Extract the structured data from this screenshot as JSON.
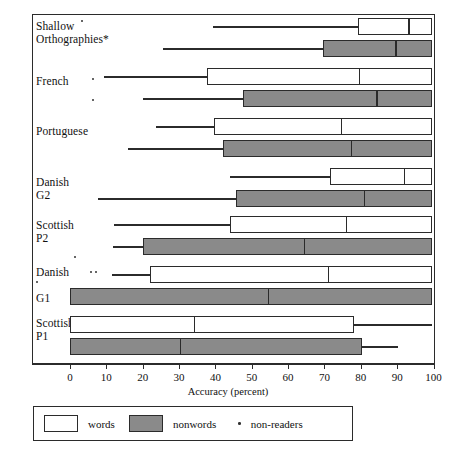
{
  "chart_data": {
    "type": "bar",
    "subtype": "grouped-horizontal-boxplot",
    "title": "",
    "xlabel": "Accuracy (percent)",
    "ylabel": "",
    "xlim": [
      0,
      100
    ],
    "xticks": [
      0,
      10,
      20,
      30,
      40,
      50,
      60,
      70,
      80,
      90,
      100
    ],
    "xticklabels": [
      "0",
      "10",
      "20",
      "30",
      "40",
      "50",
      "60",
      "70",
      "80",
      "90",
      "100"
    ],
    "grid": false,
    "legend_position": "below-axis",
    "legend": [
      {
        "key": "words",
        "label": "words",
        "marker": "open-rectangle",
        "color": "#ffffff"
      },
      {
        "key": "nonwords",
        "label": "nonwords",
        "marker": "filled-rectangle",
        "color": "#8a8a8a"
      },
      {
        "key": "non-readers",
        "label": "non-readers",
        "marker": "dot",
        "color": "#333333"
      }
    ],
    "categories": [
      "Shallow Orthographies*",
      "French",
      "Portuguese",
      "Danish G2",
      "Scottish P2",
      "Danish G1",
      "Scottish P1"
    ],
    "series": [
      {
        "name": "words",
        "boxes": [
          {
            "category": "Shallow Orthographies*",
            "whisker_low": 39.3,
            "q1": 79.1,
            "median": 93.1,
            "q3": 99.7,
            "whisker_high": 99.7
          },
          {
            "category": "French",
            "whisker_low": 9.3,
            "q1": 37.6,
            "median": 79.4,
            "q3": 99.7,
            "whisker_high": 99.7
          },
          {
            "category": "Portuguese",
            "whisker_low": 23.6,
            "q1": 39.5,
            "median": 74.5,
            "q3": 99.7,
            "whisker_high": 99.7
          },
          {
            "category": "Danish G2",
            "whisker_low": 43.9,
            "q1": 71.4,
            "median": 91.8,
            "q3": 99.7,
            "whisker_high": 99.7
          },
          {
            "category": "Scottish P2",
            "whisker_low": 12.1,
            "q1": 43.9,
            "median": 75.8,
            "q3": 99.7,
            "whisker_high": 99.7
          },
          {
            "category": "Danish G1",
            "whisker_low": 11.5,
            "q1": 22.0,
            "median": 70.9,
            "q3": 99.7,
            "whisker_high": 99.7
          },
          {
            "category": "Scottish P1",
            "whisker_low": 0.0,
            "q1": 0.0,
            "median": 34.1,
            "q3": 78.0,
            "whisker_high": 99.7
          }
        ]
      },
      {
        "name": "nonwords",
        "boxes": [
          {
            "category": "Shallow Orthographies*",
            "whisker_low": 25.5,
            "q1": 69.5,
            "median": 89.5,
            "q3": 99.7,
            "whisker_high": 99.7
          },
          {
            "category": "French",
            "whisker_low": 20.0,
            "q1": 47.5,
            "median": 84.3,
            "q3": 99.7,
            "whisker_high": 99.7
          },
          {
            "category": "Portuguese",
            "whisker_low": 15.9,
            "q1": 42.1,
            "median": 77.2,
            "q3": 99.7,
            "whisker_high": 99.7
          },
          {
            "category": "Danish G2",
            "whisker_low": 7.7,
            "q1": 45.6,
            "median": 80.8,
            "q3": 99.7,
            "whisker_high": 99.7
          },
          {
            "category": "Scottish P2",
            "whisker_low": 11.8,
            "q1": 20.0,
            "median": 64.3,
            "q3": 99.7,
            "whisker_high": 99.7
          },
          {
            "category": "Danish G1",
            "whisker_low": 0.0,
            "q1": 0.0,
            "median": 54.4,
            "q3": 99.7,
            "whisker_high": 99.7
          },
          {
            "category": "Scottish P1",
            "whisker_low": 0.0,
            "q1": 0.0,
            "median": 30.2,
            "q3": 80.2,
            "whisker_high": 90.1
          }
        ]
      }
    ],
    "non_reader_markers": [
      {
        "category": "Shallow Orthographies*",
        "count": 1
      },
      {
        "category": "French",
        "count": 2
      },
      {
        "category": "Scottish P2",
        "count": 1
      },
      {
        "category": "Danish G1",
        "count": 3
      }
    ]
  },
  "axis": {
    "title": "Accuracy (percent)",
    "ticks": [
      "0",
      "10",
      "20",
      "30",
      "40",
      "50",
      "60",
      "70",
      "80",
      "90",
      "100"
    ]
  },
  "rows": [
    {
      "line1": "Shallow",
      "line2": "Orthographies*"
    },
    {
      "line1": "French",
      "line2": ""
    },
    {
      "line1": "Portuguese",
      "line2": ""
    },
    {
      "line1": "Danish",
      "line2": "G2"
    },
    {
      "line1": "Scottish",
      "line2": "P2"
    },
    {
      "line1": "Danish",
      "line2": "G1"
    },
    {
      "line1": "Scottish",
      "line2": "P1"
    }
  ],
  "legend": {
    "words_label": "words",
    "nonwords_label": "nonwords",
    "nonreaders_label": "non-readers"
  },
  "colors": {
    "words_fill": "#ffffff",
    "nonwords_fill": "#8a8a8a",
    "line": "#2b2b2b",
    "dot": "#333333"
  }
}
